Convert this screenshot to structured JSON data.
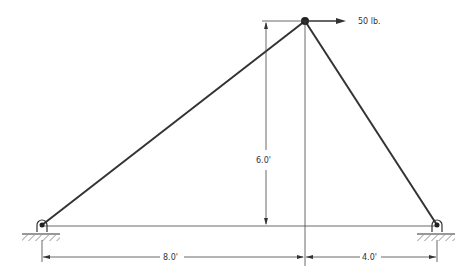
{
  "diagram": {
    "type": "truss",
    "load": {
      "label": "50 lb.",
      "direction": "right"
    },
    "dimensions": {
      "height": "6.0'",
      "left_span": "8.0'",
      "right_span": "4.0'"
    },
    "supports": [
      "pin-left",
      "pin-right"
    ],
    "colors": {
      "member": "#333333",
      "line": "#444444"
    }
  }
}
